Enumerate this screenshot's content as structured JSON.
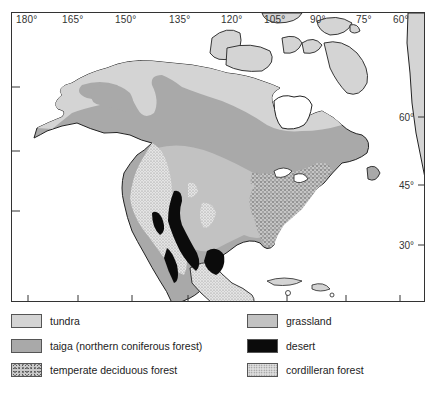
{
  "map": {
    "title_partial": "",
    "longitude_labels": [
      "180°",
      "165°",
      "150°",
      "135°",
      "120°",
      "105°",
      "90°",
      "75°",
      "60°"
    ],
    "latitude_labels": [
      "60°",
      "45°",
      "30°"
    ],
    "colors": {
      "tundra": "#d4d4d4",
      "taiga": "#a9a9a9",
      "grassland": "#c2c2c2",
      "desert": "#0b0b0b",
      "temperate_deciduous_forest": "#c8c8c8",
      "cordilleran_forest": "#e0e0e0",
      "water": "#ffffff",
      "coastline": "#222222"
    }
  },
  "legend": {
    "items": [
      {
        "key": "tundra",
        "label": "tundra"
      },
      {
        "key": "taiga",
        "label": "taiga (northern coniferous forest)"
      },
      {
        "key": "temperate_deciduous_forest",
        "label": "temperate deciduous forest"
      },
      {
        "key": "grassland",
        "label": "grassland"
      },
      {
        "key": "desert",
        "label": "desert"
      },
      {
        "key": "cordilleran_forest",
        "label": "cordilleran forest"
      }
    ]
  }
}
